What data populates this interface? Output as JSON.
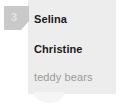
{
  "card": {
    "badge": {
      "icon": "folded-corner-badge",
      "count": "3",
      "background_color": "#c9c9c9",
      "text_color": "#e4e4e4"
    },
    "background_color": "#ededed",
    "tail_color": "#f5f5f5",
    "entries": [
      {
        "label": "Selina",
        "style": "bold",
        "color": "#1b1b1b"
      },
      {
        "label": "Christine",
        "style": "bold",
        "color": "#1b1b1b"
      }
    ],
    "tag": {
      "label": "teddy bears",
      "color": "#9a9a9a"
    }
  }
}
